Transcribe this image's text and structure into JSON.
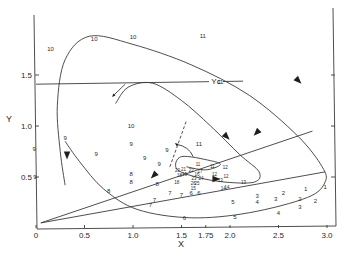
{
  "chart_data": {
    "type": "line",
    "title": "",
    "xlabel": "X",
    "ylabel": "Y",
    "xlim": [
      0,
      3.1
    ],
    "ylim": [
      0,
      2.0
    ],
    "grid": false,
    "x_ticks": [
      {
        "value": 0,
        "label": "0"
      },
      {
        "value": 0.5,
        "label": "0.5"
      },
      {
        "value": 1.0,
        "label": "1.0"
      },
      {
        "value": 1.5,
        "label": "1.5"
      },
      {
        "value": 1.75,
        "label": "1.75"
      },
      {
        "value": 2.0,
        "label": "2.0"
      },
      {
        "value": 2.5,
        "label": "2.5"
      },
      {
        "value": 3.0,
        "label": "3.0"
      }
    ],
    "y_ticks": [
      {
        "value": 0.5,
        "label": "0.5"
      },
      {
        "value": 1.0,
        "label": "1.0"
      },
      {
        "value": 1.5,
        "label": "1.5"
      }
    ],
    "reference_lines": [
      {
        "name": "Yc",
        "label": "Yc",
        "type": "horizontal",
        "y": 1.41,
        "x_range": [
          0,
          3.5
        ]
      },
      {
        "name": "ray-upper",
        "type": "segment",
        "points": [
          [
            0.05,
            0.05
          ],
          [
            2.85,
            0.95
          ]
        ]
      },
      {
        "name": "ray-lower",
        "type": "segment",
        "points": [
          [
            0.05,
            0.05
          ],
          [
            2.98,
            0.55
          ]
        ]
      }
    ],
    "series": [
      {
        "name": "outer-trajectory",
        "points": [
          [
            0.3,
            0.42
          ],
          [
            0.25,
            0.75
          ],
          [
            0.22,
            1.2
          ],
          [
            0.3,
            1.65
          ],
          [
            0.55,
            1.88
          ],
          [
            1.0,
            1.8
          ],
          [
            1.6,
            1.6
          ],
          [
            2.2,
            1.3
          ],
          [
            2.7,
            0.9
          ],
          [
            2.95,
            0.6
          ],
          [
            2.98,
            0.45
          ],
          [
            2.8,
            0.3
          ],
          [
            2.2,
            0.15
          ],
          [
            1.6,
            0.1
          ],
          [
            1.05,
            0.18
          ],
          [
            0.7,
            0.38
          ],
          [
            0.45,
            0.65
          ],
          [
            0.3,
            0.85
          ]
        ]
      },
      {
        "name": "inner-trajectory",
        "points": [
          [
            0.82,
            1.22
          ],
          [
            0.95,
            1.38
          ],
          [
            1.2,
            1.42
          ],
          [
            1.5,
            1.25
          ],
          [
            1.8,
            1.0
          ],
          [
            2.1,
            0.72
          ],
          [
            2.3,
            0.55
          ],
          [
            2.25,
            0.45
          ],
          [
            1.95,
            0.45
          ],
          [
            1.65,
            0.5
          ],
          [
            1.45,
            0.58
          ],
          [
            1.5,
            0.7
          ],
          [
            1.8,
            0.66
          ],
          [
            1.9,
            0.62
          ],
          [
            1.75,
            0.57
          ],
          [
            1.55,
            0.6
          ]
        ]
      }
    ],
    "point_labels": [
      {
        "label": "10",
        "x": 0.15,
        "y": 1.75
      },
      {
        "label": "10",
        "x": 0.6,
        "y": 1.85
      },
      {
        "label": "10",
        "x": 1.0,
        "y": 1.87
      },
      {
        "label": "11",
        "x": 1.72,
        "y": 1.88
      },
      {
        "label": "11",
        "x": 1.9,
        "y": 1.43
      },
      {
        "label": "10",
        "x": 0.98,
        "y": 1.0
      },
      {
        "label": "9",
        "x": -0.02,
        "y": 0.77
      },
      {
        "label": "9",
        "x": -0.01,
        "y": 0.5
      },
      {
        "label": "9",
        "x": 0.3,
        "y": 0.88
      },
      {
        "label": "9",
        "x": 0.98,
        "y": 0.82
      },
      {
        "label": "9",
        "x": 0.62,
        "y": 0.72
      },
      {
        "label": "9",
        "x": 1.12,
        "y": 0.68
      },
      {
        "label": "9",
        "x": 1.35,
        "y": 0.76
      },
      {
        "label": "9",
        "x": 1.27,
        "y": 0.62
      },
      {
        "label": "8",
        "x": 0.98,
        "y": 0.53
      },
      {
        "label": "8",
        "x": 0.98,
        "y": 0.45
      },
      {
        "label": "8",
        "x": 0.75,
        "y": 0.36
      },
      {
        "label": "8",
        "x": 1.25,
        "y": 0.43
      },
      {
        "label": "7",
        "x": 1.22,
        "y": 0.27
      },
      {
        "label": "7",
        "x": 1.38,
        "y": 0.34
      },
      {
        "label": "7",
        "x": 1.5,
        "y": 0.32
      },
      {
        "label": "7",
        "x": 1.18,
        "y": 0.22
      },
      {
        "label": "6",
        "x": 1.6,
        "y": 0.34
      },
      {
        "label": "6",
        "x": 1.68,
        "y": 0.34
      },
      {
        "label": "6",
        "x": 1.53,
        "y": 0.09
      },
      {
        "label": "5",
        "x": 2.03,
        "y": 0.25
      },
      {
        "label": "5",
        "x": 2.05,
        "y": 0.1
      },
      {
        "label": "4",
        "x": 2.28,
        "y": 0.25
      },
      {
        "label": "4",
        "x": 2.5,
        "y": 0.14
      },
      {
        "label": "3",
        "x": 2.28,
        "y": 0.31
      },
      {
        "label": "3",
        "x": 2.47,
        "y": 0.28
      },
      {
        "label": "3",
        "x": 2.72,
        "y": 0.2
      },
      {
        "label": "2",
        "x": 2.55,
        "y": 0.34
      },
      {
        "label": "2",
        "x": 2.72,
        "y": 0.28
      },
      {
        "label": "2",
        "x": 2.88,
        "y": 0.26
      },
      {
        "label": "1",
        "x": 2.78,
        "y": 0.38
      },
      {
        "label": "1",
        "x": 2.98,
        "y": 0.4
      },
      {
        "label": "20",
        "x": 1.46,
        "y": 0.56
      },
      {
        "label": "21",
        "x": 1.52,
        "y": 0.57
      },
      {
        "label": "22",
        "x": 1.6,
        "y": 0.56
      },
      {
        "label": "17",
        "x": 1.69,
        "y": 0.55
      },
      {
        "label": "18",
        "x": 1.48,
        "y": 0.51
      },
      {
        "label": "19",
        "x": 1.53,
        "y": 0.52
      },
      {
        "label": "16",
        "x": 1.66,
        "y": 0.52
      },
      {
        "label": "18",
        "x": 1.45,
        "y": 0.44
      },
      {
        "label": "23",
        "x": 1.63,
        "y": 0.48
      },
      {
        "label": "24",
        "x": 1.7,
        "y": 0.48
      },
      {
        "label": "26",
        "x": 1.62,
        "y": 0.43
      },
      {
        "label": "25",
        "x": 1.66,
        "y": 0.43
      },
      {
        "label": "15",
        "x": 1.62,
        "y": 0.38
      },
      {
        "label": "11",
        "x": 1.67,
        "y": 0.62
      },
      {
        "label": "11",
        "x": 1.82,
        "y": 0.6
      },
      {
        "label": "11",
        "x": 1.68,
        "y": 0.82
      },
      {
        "label": "12",
        "x": 1.95,
        "y": 0.59
      },
      {
        "label": "12",
        "x": 1.84,
        "y": 0.52
      },
      {
        "label": "12",
        "x": 1.96,
        "y": 0.5
      },
      {
        "label": "13",
        "x": 1.9,
        "y": 0.46
      },
      {
        "label": "13",
        "x": 2.14,
        "y": 0.44
      },
      {
        "label": "14",
        "x": 1.97,
        "y": 0.39
      },
      {
        "label": "14",
        "x": 1.93,
        "y": 0.38
      }
    ],
    "annotations": [
      {
        "type": "arrow-on-curve",
        "series": "outer-trajectory",
        "at": [
          2.7,
          1.45
        ],
        "direction": "down-right"
      },
      {
        "type": "arrow-on-curve",
        "series": "outer-trajectory",
        "at": [
          0.32,
          0.72
        ],
        "direction": "down"
      },
      {
        "type": "arrow-on-curve",
        "series": "outer-trajectory",
        "at": [
          1.85,
          0.48
        ],
        "direction": "right"
      },
      {
        "type": "arrow-on-curve",
        "series": "inner-trajectory",
        "at": [
          1.96,
          0.9
        ],
        "direction": "down-right"
      },
      {
        "type": "arrow-free",
        "at": [
          2.28,
          0.94
        ],
        "direction": "down-left"
      },
      {
        "type": "arrow-free",
        "at": [
          1.22,
          0.52
        ],
        "direction": "down-left"
      },
      {
        "type": "arrow-small",
        "from": [
          0.92,
          1.41
        ],
        "to": [
          0.8,
          1.3
        ]
      },
      {
        "type": "arrow-small",
        "from": [
          1.62,
          0.7
        ],
        "to": [
          1.45,
          0.82
        ]
      },
      {
        "type": "dashed-line",
        "points": [
          [
            1.38,
            0.6
          ],
          [
            1.55,
            1.05
          ]
        ]
      }
    ]
  }
}
